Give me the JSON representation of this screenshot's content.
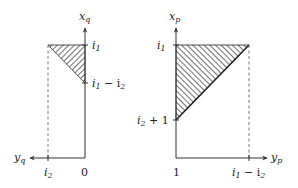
{
  "left_panel": {
    "vertical_axis_label": "x",
    "vertical_axis_sub": "q",
    "horizontal_axis_label": "y",
    "horizontal_axis_sub": "q",
    "origin_label": "0",
    "ticks_vertical": [
      {
        "main": "i",
        "sub": "1",
        "rest": ""
      },
      {
        "main": "i",
        "sub": "1",
        "rest": " − i",
        "sub2": "2"
      }
    ],
    "ticks_horizontal": [
      {
        "main": "i",
        "sub": "2"
      }
    ],
    "region": "hatched triangle bounded by i1, i1 − i2 and i2"
  },
  "right_panel": {
    "vertical_axis_label": "x",
    "vertical_axis_sub": "p",
    "horizontal_axis_label": "y",
    "horizontal_axis_sub": "p",
    "origin_label": "1",
    "ticks_vertical": [
      {
        "main": "i",
        "sub": "1",
        "rest": ""
      },
      {
        "main": "i",
        "sub": "2",
        "rest": " + 1"
      }
    ],
    "ticks_horizontal": [
      {
        "main": "i",
        "sub": "1",
        "rest": " − i",
        "sub2": "2"
      }
    ],
    "region": "hatched triangle bounded by i1, i2 + 1 and i1 − i2"
  },
  "colors": {
    "axis": "#333333",
    "hatch": "#222222",
    "dashed": "#555555"
  }
}
